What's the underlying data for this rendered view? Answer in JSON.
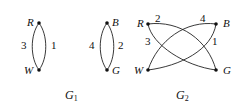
{
  "graphs": [
    {
      "name": "G",
      "subscript": "1",
      "components": [
        {
          "vertices": [
            {
              "label": "R"
            },
            {
              "label": "W"
            }
          ],
          "edges": [
            {
              "from": "R",
              "to": "W",
              "label": "3"
            },
            {
              "from": "R",
              "to": "W",
              "label": "1"
            }
          ]
        },
        {
          "vertices": [
            {
              "label": "B"
            },
            {
              "label": "G"
            }
          ],
          "edges": [
            {
              "from": "B",
              "to": "G",
              "label": "4"
            },
            {
              "from": "B",
              "to": "G",
              "label": "2"
            }
          ]
        }
      ]
    },
    {
      "name": "G",
      "subscript": "2",
      "vertices": [
        {
          "label": "R"
        },
        {
          "label": "B"
        },
        {
          "label": "W"
        },
        {
          "label": "G"
        }
      ],
      "edges": [
        {
          "from": "R",
          "to": "G",
          "label": "2"
        },
        {
          "from": "W",
          "to": "B",
          "label": "4"
        },
        {
          "from": "R",
          "to": "G",
          "label": "3"
        },
        {
          "from": "W",
          "to": "B",
          "label": "1"
        }
      ]
    }
  ],
  "labels": {
    "g1": {
      "R": "R",
      "W": "W",
      "B": "B",
      "G": "G",
      "e3": "3",
      "e1": "1",
      "e4": "4",
      "e2": "2"
    },
    "g2": {
      "R": "R",
      "W": "W",
      "B": "B",
      "G": "G",
      "e2": "2",
      "e4": "4",
      "e3": "3",
      "e1": "1"
    },
    "captions": {
      "g1_name": "G",
      "g1_sub": "1",
      "g2_name": "G",
      "g2_sub": "2"
    }
  }
}
